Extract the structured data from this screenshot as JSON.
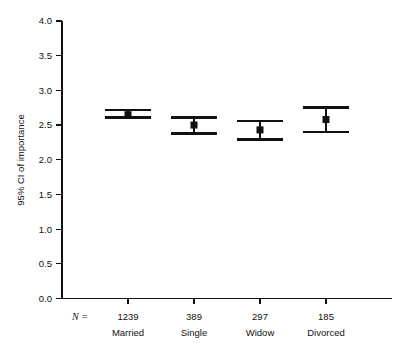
{
  "chart_data": {
    "type": "scatter",
    "title": "",
    "xlabel": "",
    "ylabel": "95% CI of importance",
    "ylim": [
      0.0,
      4.0
    ],
    "ytick_labels": [
      "0.0",
      "0.5",
      "1.0",
      "1.5",
      "2.0",
      "2.5",
      "3.0",
      "3.5",
      "4.0"
    ],
    "ytick_values": [
      0.0,
      0.5,
      1.0,
      1.5,
      2.0,
      2.5,
      3.0,
      3.5,
      4.0
    ],
    "grid": false,
    "legend": "none",
    "n_prefix": "N =",
    "categories": [
      "Married",
      "Single",
      "Widow",
      "Divorced"
    ],
    "n_values": [
      "1239",
      "389",
      "297",
      "185"
    ],
    "series": [
      {
        "name": "95% CI of importance",
        "means": [
          2.65,
          2.5,
          2.43,
          2.58
        ],
        "ci_lower": [
          2.61,
          2.38,
          2.29,
          2.4
        ],
        "ci_upper": [
          2.72,
          2.61,
          2.56,
          2.75
        ]
      }
    ],
    "points": [
      {
        "category": "Married",
        "n": "1239",
        "mean": 2.65,
        "ci_lower": 2.61,
        "ci_upper": 2.72
      },
      {
        "category": "Single",
        "n": "389",
        "mean": 2.5,
        "ci_lower": 2.38,
        "ci_upper": 2.61
      },
      {
        "category": "Widow",
        "n": "297",
        "mean": 2.43,
        "ci_lower": 2.29,
        "ci_upper": 2.56
      },
      {
        "category": "Divorced",
        "n": "185",
        "mean": 2.58,
        "ci_lower": 2.4,
        "ci_upper": 2.75
      }
    ],
    "colors": {
      "marker": "#111111",
      "axis": "#111111",
      "background": "#ffffff"
    }
  }
}
